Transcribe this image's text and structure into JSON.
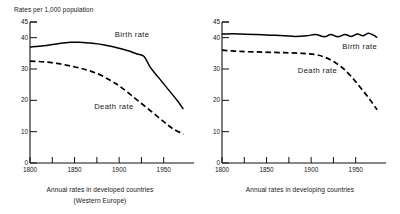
{
  "chart_data": [
    {
      "type": "line",
      "panel": "left",
      "title": "Rates per 1,000 population",
      "caption_line1": "Annual rates in developed countries",
      "caption_line2": "(Western Europe)",
      "xlabel": "",
      "ylabel": "Rates per 1,000 population",
      "xlim": [
        1800,
        1975
      ],
      "ylim": [
        0,
        45
      ],
      "grid": false,
      "legend_position": "inline-annotation",
      "y_ticks": [
        0,
        10,
        20,
        30,
        40,
        45
      ],
      "y_tick_labels": [
        "0",
        "10",
        "20",
        "30",
        "40",
        "45"
      ],
      "x_ticks": [
        1800,
        1825,
        1850,
        1875,
        1900,
        1925,
        1950
      ],
      "x_tick_labels": [
        "1800",
        "",
        "1850",
        "",
        "1900",
        "",
        "1950"
      ],
      "series": [
        {
          "name": "Birth rate",
          "style": "solid",
          "color": "#000000",
          "x": [
            1800,
            1815,
            1830,
            1845,
            1855,
            1870,
            1885,
            1900,
            1910,
            1920,
            1928,
            1935,
            1945,
            1955,
            1965,
            1972
          ],
          "values": [
            37.0,
            37.4,
            38.0,
            38.5,
            38.5,
            38.2,
            37.6,
            36.6,
            35.8,
            34.8,
            34.0,
            30.5,
            27.0,
            23.5,
            20.0,
            17.2
          ]
        },
        {
          "name": "Death rate",
          "style": "dashed",
          "color": "#000000",
          "x": [
            1800,
            1815,
            1830,
            1845,
            1860,
            1875,
            1890,
            1900,
            1912,
            1925,
            1938,
            1950,
            1960,
            1972
          ],
          "values": [
            32.5,
            32.3,
            31.8,
            31.0,
            30.0,
            28.6,
            26.4,
            24.6,
            22.0,
            19.0,
            16.0,
            13.2,
            11.0,
            9.2
          ]
        }
      ],
      "annotations": [
        {
          "text": "Birth rate",
          "x": 1895,
          "y": 41.0
        },
        {
          "text": "Death rate",
          "x": 1872,
          "y": 18.0
        }
      ]
    },
    {
      "type": "line",
      "panel": "right",
      "title": "",
      "caption_line1": "Annual rates in developing countries",
      "caption_line2": "",
      "xlabel": "",
      "ylabel": "",
      "xlim": [
        1800,
        1975
      ],
      "ylim": [
        0,
        45
      ],
      "grid": false,
      "legend_position": "inline-annotation",
      "y_ticks": [
        0,
        10,
        20,
        30,
        40,
        45
      ],
      "y_tick_labels": [
        "0",
        "10",
        "20",
        "30",
        "40",
        "45"
      ],
      "x_ticks": [
        1800,
        1825,
        1850,
        1875,
        1900,
        1925,
        1950
      ],
      "x_tick_labels": [
        "1800",
        "",
        "1850",
        "",
        "1900",
        "",
        "1950"
      ],
      "series": [
        {
          "name": "Birth rate",
          "style": "solid",
          "color": "#000000",
          "x": [
            1800,
            1820,
            1840,
            1855,
            1870,
            1882,
            1895,
            1905,
            1915,
            1922,
            1930,
            1938,
            1945,
            1952,
            1958,
            1964,
            1970,
            1974
          ],
          "values": [
            41.2,
            41.2,
            41.0,
            40.8,
            40.6,
            40.4,
            40.6,
            41.0,
            40.3,
            41.0,
            40.3,
            41.0,
            40.4,
            41.2,
            40.6,
            41.4,
            40.8,
            40.0
          ]
        },
        {
          "name": "Death rate",
          "style": "dashed",
          "color": "#000000",
          "x": [
            1800,
            1820,
            1845,
            1870,
            1890,
            1905,
            1915,
            1925,
            1935,
            1945,
            1955,
            1965,
            1974
          ],
          "values": [
            36.0,
            35.6,
            35.4,
            35.2,
            35.0,
            34.6,
            33.8,
            32.4,
            30.4,
            27.6,
            24.2,
            20.6,
            17.0
          ]
        }
      ],
      "annotations": [
        {
          "text": "Birth rate",
          "x": 1935,
          "y": 37.0
        },
        {
          "text": "Death rate",
          "x": 1885,
          "y": 29.5
        }
      ]
    }
  ]
}
